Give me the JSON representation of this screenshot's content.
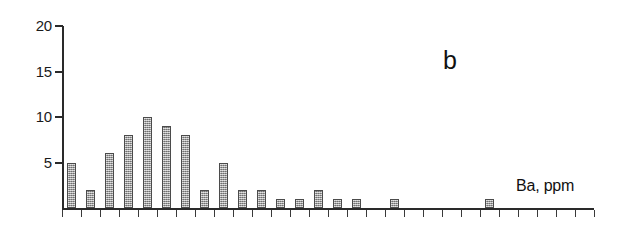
{
  "figure": {
    "panel_label": "b",
    "axis_title": "Ba, ppm"
  },
  "chart_data": {
    "type": "bar",
    "title": "",
    "subtitle": "",
    "panel": "b",
    "xlabel": "Ba, ppm",
    "ylabel": "",
    "ylim": [
      0,
      20
    ],
    "y_ticks": [
      5,
      10,
      15,
      20
    ],
    "y_tick_labels": [
      "5",
      "10",
      "15",
      "20"
    ],
    "grid": false,
    "legend": null,
    "x_axis_labelled": false,
    "n_bins": 28,
    "categories": [
      "1",
      "2",
      "3",
      "4",
      "5",
      "6",
      "7",
      "8",
      "9",
      "10",
      "11",
      "12",
      "13",
      "14",
      "15",
      "16",
      "17",
      "18",
      "19",
      "20",
      "21",
      "22",
      "23",
      "24",
      "25",
      "26",
      "27",
      "28"
    ],
    "values": [
      5,
      2,
      6,
      8,
      10,
      9,
      8,
      2,
      5,
      2,
      2,
      1,
      1,
      2,
      1,
      1,
      0,
      1,
      0,
      0,
      0,
      0,
      1,
      0,
      0,
      0,
      0,
      0
    ],
    "bar_color": "#9a9a9a",
    "bar_edge_color": "#4b4b4b",
    "axis_color": "#2a2a2a"
  },
  "y_axis": {
    "ticks": [
      {
        "label": "20",
        "value": 20
      },
      {
        "label": "15",
        "value": 15
      },
      {
        "label": "10",
        "value": 10
      },
      {
        "label": "5",
        "value": 5
      }
    ]
  }
}
